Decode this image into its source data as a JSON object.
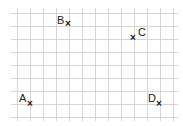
{
  "diagram": {
    "type": "grid-points",
    "grid": {
      "cell_size": 13,
      "x_lines": [
        17,
        30,
        43,
        56,
        69,
        82,
        95,
        108,
        121,
        134,
        147,
        160,
        173
      ],
      "y_lines": [
        13,
        26,
        39,
        52,
        65,
        78,
        91,
        104,
        117
      ],
      "line_color": "#d6d6d6"
    },
    "marker_symbol": "×",
    "points": [
      {
        "name": "A",
        "x": 30,
        "y": 104
      },
      {
        "name": "B",
        "x": 69,
        "y": 26
      },
      {
        "name": "C",
        "x": 134,
        "y": 39
      },
      {
        "name": "D",
        "x": 160,
        "y": 104
      }
    ]
  }
}
